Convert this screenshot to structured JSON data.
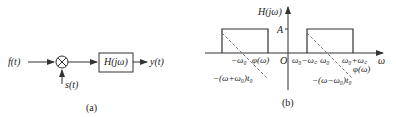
{
  "panel_a": {
    "input_label": "f(t)",
    "modulator_label": "s(t)",
    "filter_label": "H(jω)",
    "output_label": "y(t)",
    "caption": "(a)"
  },
  "panel_b": {
    "y_axis_label": "H(jω)",
    "x_axis_label": "ω",
    "origin_label": "O",
    "amplitude_label": "A",
    "tick_neg_w0": "−ω₀",
    "phase_left_label": "φ(ω)",
    "tick_w0_minus_wc": "ω₀−ω꜀",
    "tick_w0": "ω₀",
    "tick_w0_plus_wc": "ω₀+ω꜀",
    "phase_right_label": "φ(ω)",
    "phase_left_expr": "−(ω+ω₀)t₀",
    "phase_right_expr": "−(ω−ω₀)t₀",
    "caption": "(b)"
  },
  "colors": {
    "line": "#333333",
    "dash": "#555555"
  }
}
